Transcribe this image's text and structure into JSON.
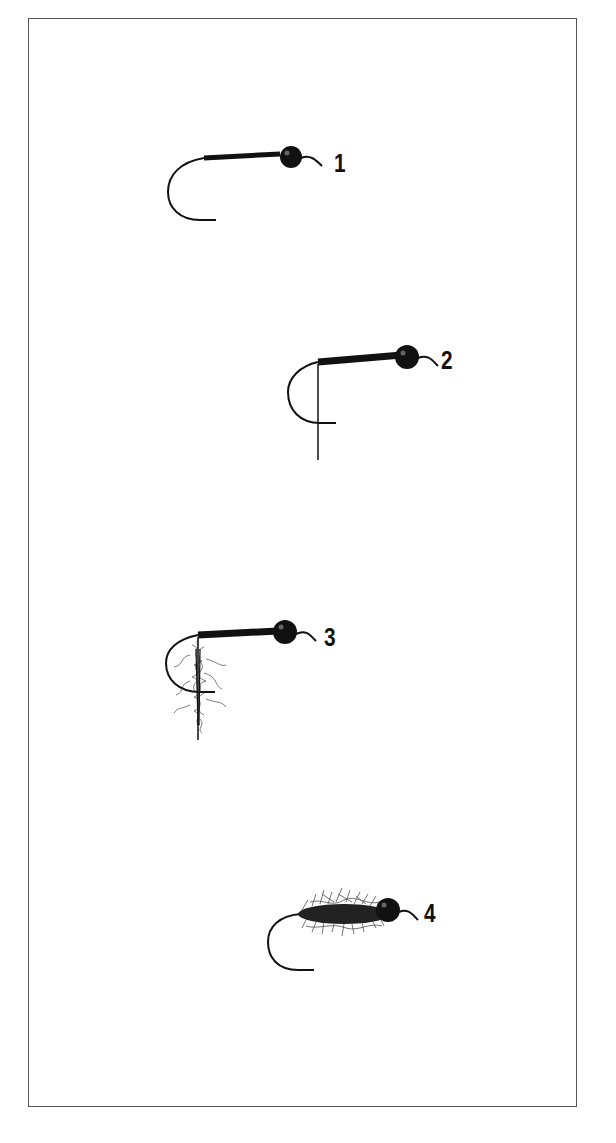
{
  "diagram": {
    "title": "",
    "ink_color": "#111111",
    "frame_color": "#555555",
    "steps": [
      {
        "number": "1",
        "description": "Hook with bead head and thread wrapped along shank"
      },
      {
        "number": "2",
        "description": "Thread base extended to bend with thread hanging down"
      },
      {
        "number": "3",
        "description": "Dubbing loop of fur formed on hanging thread"
      },
      {
        "number": "4",
        "description": "Finished fuzzy dubbed body behind bead head"
      }
    ]
  }
}
